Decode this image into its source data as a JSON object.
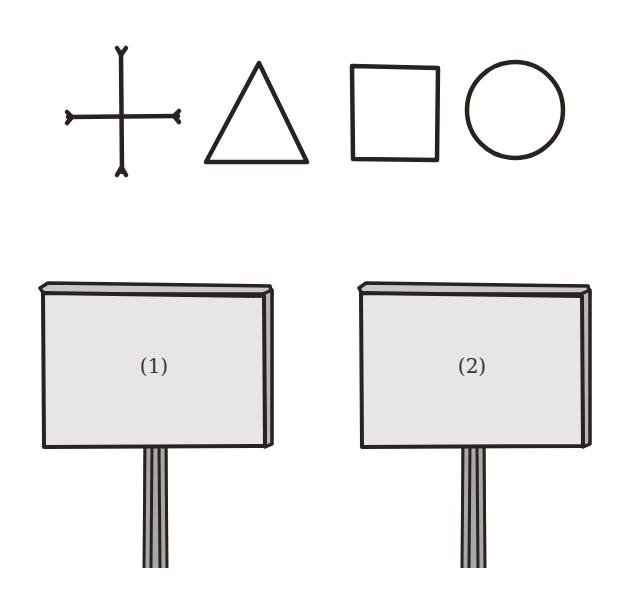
{
  "shapes": [
    {
      "name": "cross",
      "icon": "cross-with-forked-ends"
    },
    {
      "name": "triangle",
      "icon": "triangle-outline"
    },
    {
      "name": "square",
      "icon": "square-outline"
    },
    {
      "name": "circle",
      "icon": "circle-outline"
    }
  ],
  "signs": [
    {
      "label": "(1)"
    },
    {
      "label": "(2)"
    }
  ],
  "colors": {
    "ink": "#2a2220",
    "board": "#e6e6e4",
    "board_top": "#c8c8c6",
    "post": "#a8a8a6"
  }
}
